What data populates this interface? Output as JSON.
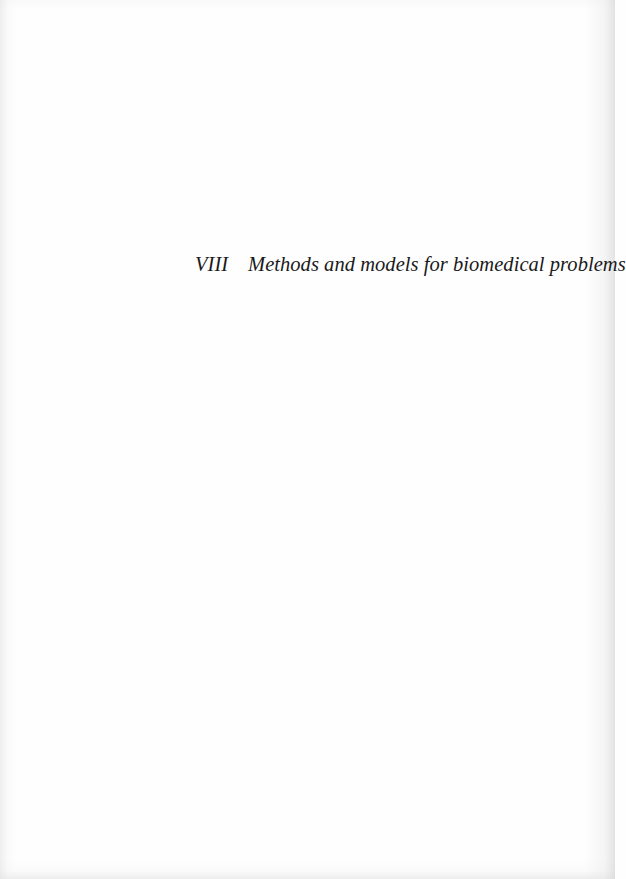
{
  "page": {
    "type": "part-title-page",
    "background_color": "#fefefe",
    "text_color": "#1a1a1a"
  },
  "heading": {
    "part_number": "VIII",
    "part_title": "Methods and models for biomedical problems"
  }
}
